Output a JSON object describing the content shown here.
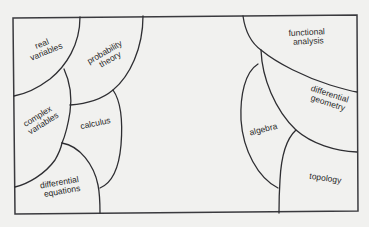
{
  "diagram": {
    "type": "area-map of mathematics",
    "colors": {
      "background": "#f1f1ef",
      "line": "#2e2e32",
      "text": "#2a2a2a"
    },
    "regions": [
      {
        "id": "real-variables",
        "line1": "real",
        "line2": "variables"
      },
      {
        "id": "probability-theory",
        "line1": "probability",
        "line2": "theory"
      },
      {
        "id": "complex-variables",
        "line1": "complex",
        "line2": "variables"
      },
      {
        "id": "calculus",
        "line1": "calculus"
      },
      {
        "id": "differential-equations",
        "line1": "differential",
        "line2": "equations"
      },
      {
        "id": "functional-analysis",
        "line1": "functional",
        "line2": "analysis"
      },
      {
        "id": "differential-geometry",
        "line1": "differential",
        "line2": "geometry"
      },
      {
        "id": "algebra",
        "line1": "algebra"
      },
      {
        "id": "topology",
        "line1": "topology"
      }
    ]
  }
}
